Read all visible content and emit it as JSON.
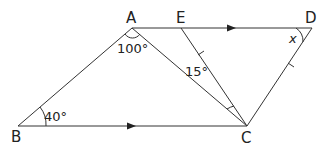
{
  "diagram": {
    "points": {
      "A": {
        "label": "A",
        "x": 132,
        "y": 28
      },
      "E": {
        "label": "E",
        "x": 181,
        "y": 28
      },
      "D": {
        "label": "D",
        "x": 312,
        "y": 28
      },
      "B": {
        "label": "B",
        "x": 18,
        "y": 126
      },
      "C": {
        "label": "C",
        "x": 247,
        "y": 126
      }
    },
    "angles": {
      "A": "100°",
      "B": "40°",
      "ACE": "15°",
      "D": "x"
    },
    "segments": [
      "AE",
      "ED",
      "AB",
      "BC",
      "AC",
      "EC",
      "DC"
    ],
    "parallel_arrows": [
      "AD",
      "BC"
    ],
    "equal_ticks": [
      "EC",
      "DC"
    ]
  }
}
